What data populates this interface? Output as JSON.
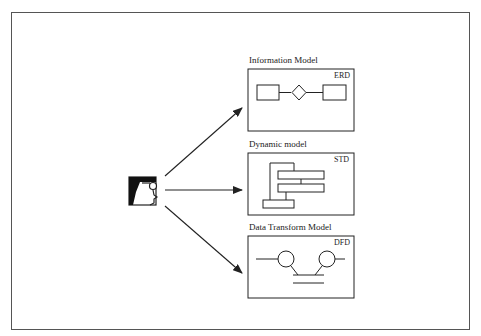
{
  "diagram": {
    "actor": {
      "icon": "analyst-profile-icon"
    },
    "models": [
      {
        "title": "Information Model",
        "tag": "ERD",
        "kind": "entity-relationship"
      },
      {
        "title": "Dynamic model",
        "tag": "STD",
        "kind": "state-transition"
      },
      {
        "title": "Data Transform Model",
        "tag": "DFD",
        "kind": "data-flow"
      }
    ],
    "colors": {
      "line": "#222222",
      "frame": "#555555",
      "background": "#ffffff"
    }
  }
}
